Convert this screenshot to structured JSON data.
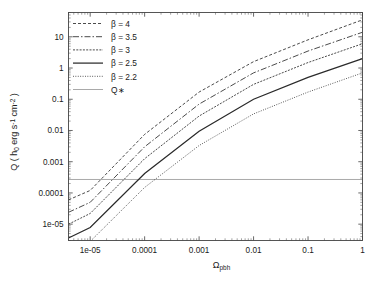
{
  "figure": {
    "background_color": "#ffffff",
    "axis_color": "#444444",
    "curve_color": "#2b2b2b",
    "qstar_color": "#9a9a9a"
  },
  "chart_data": {
    "type": "line",
    "title": "",
    "xlabel": "Ω_pbh",
    "xlabel_base": "Ω",
    "xlabel_sub": "pbh",
    "ylabel": "Q ( h0 erg s^-1 cm^-2 )",
    "xscale": "log",
    "yscale": "log",
    "xlim": [
      4e-06,
      1
    ],
    "ylim": [
      3e-06,
      60
    ],
    "grid": false,
    "legend_position": "upper left",
    "xticks": [
      1e-05,
      0.0001,
      0.001,
      0.01,
      0.1,
      1
    ],
    "xticklabels": [
      "1e-05",
      "0.0001",
      "0.001",
      "0.01",
      "0.1",
      "1"
    ],
    "yticks": [
      1e-05,
      0.0001,
      0.001,
      0.01,
      0.1,
      1,
      10
    ],
    "yticklabels": [
      "1e-05",
      "0.0001",
      "0.001",
      "0.01",
      "0.1",
      "1",
      "10"
    ],
    "series": [
      {
        "name": "β = 4",
        "legend_label": "β = 4",
        "linestyle": "dashed",
        "dasharray": "3,2",
        "linewidth": 0.85,
        "x": [
          4e-06,
          1e-05,
          0.0001,
          0.001,
          0.01,
          0.1,
          1
        ],
        "y": [
          6e-05,
          0.00012,
          0.0075,
          0.17,
          1.6,
          8.0,
          35.0
        ]
      },
      {
        "name": "β = 3.5",
        "legend_label": "β = 3.5",
        "linestyle": "dashdot",
        "dasharray": "6,2,1.5,2",
        "linewidth": 0.85,
        "x": [
          4e-06,
          1e-05,
          0.0001,
          0.001,
          0.01,
          0.1,
          1
        ],
        "y": [
          2.4e-05,
          5e-05,
          0.003,
          0.07,
          0.7,
          3.5,
          14.0
        ]
      },
      {
        "name": "β = 3",
        "legend_label": "β = 3",
        "linestyle": "densely dashed",
        "dasharray": "2,1.3",
        "linewidth": 0.85,
        "x": [
          4e-06,
          1e-05,
          0.0001,
          0.001,
          0.01,
          0.1,
          1
        ],
        "y": [
          1e-05,
          2.2e-05,
          0.00125,
          0.029,
          0.3,
          1.5,
          6.0
        ]
      },
      {
        "name": "β = 2.5",
        "legend_label": "β = 2.5",
        "linestyle": "solid",
        "dasharray": "",
        "linewidth": 1.25,
        "x": [
          4e-06,
          1e-05,
          0.0001,
          0.001,
          0.01,
          0.1,
          1
        ],
        "y": [
          3.6e-06,
          7.8e-06,
          0.00042,
          0.0095,
          0.1,
          0.5,
          2.0
        ]
      },
      {
        "name": "β = 2.2",
        "legend_label": "β = 2.2",
        "linestyle": "dotted",
        "dasharray": "0.9,1.5",
        "linewidth": 0.85,
        "x": [
          4e-06,
          1e-05,
          0.0001,
          0.001,
          0.01,
          0.1,
          1
        ],
        "y": [
          1.35e-06,
          2.8e-06,
          0.00015,
          0.0033,
          0.034,
          0.17,
          0.7
        ]
      }
    ],
    "reference_lines": [
      {
        "name": "Q*",
        "legend_label": "Q∗",
        "orientation": "horizontal",
        "value": 0.00027,
        "linestyle": "solid",
        "color": "#9a9a9a",
        "linewidth": 0.85
      }
    ],
    "legend_entries": [
      {
        "label": "β = 4",
        "linestyle": "dashed",
        "dasharray": "3,2",
        "color": "#2b2b2b",
        "linewidth": 0.85
      },
      {
        "label": "β = 3.5",
        "linestyle": "dashdot",
        "dasharray": "6,2,1.5,2",
        "color": "#2b2b2b",
        "linewidth": 0.85
      },
      {
        "label": "β = 3",
        "linestyle": "densely dashed",
        "dasharray": "2,1.3",
        "color": "#2b2b2b",
        "linewidth": 0.85
      },
      {
        "label": "β = 2.5",
        "linestyle": "solid",
        "dasharray": "",
        "color": "#2b2b2b",
        "linewidth": 1.25
      },
      {
        "label": "β = 2.2",
        "linestyle": "dotted",
        "dasharray": "0.9,1.5",
        "color": "#2b2b2b",
        "linewidth": 0.85
      },
      {
        "label": "Q∗",
        "linestyle": "solid",
        "dasharray": "",
        "color": "#9a9a9a",
        "linewidth": 0.85
      }
    ]
  },
  "ylabel_parts": {
    "p1": "Q ( h",
    "p2": "0",
    "p3": " erg s",
    "p4": "-1",
    "p5": " cm",
    "p6": "-2",
    "p7": " )"
  }
}
